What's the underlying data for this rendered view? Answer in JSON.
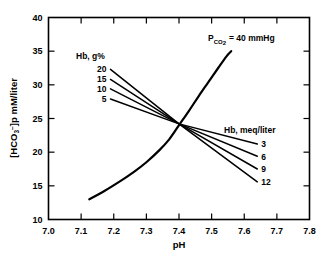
{
  "chart_data": {
    "type": "line",
    "title": "",
    "xlabel": "pH",
    "ylabel": "[HCO₃⁻]p mM/liter",
    "xlim": [
      7.0,
      7.8
    ],
    "ylim": [
      10,
      40
    ],
    "xticks": [
      "7.0",
      "7.1",
      "7.2",
      "7.3",
      "7.4",
      "7.5",
      "7.6",
      "7.7",
      "7.8"
    ],
    "yticks": [
      "10",
      "15",
      "20",
      "25",
      "30",
      "35",
      "40"
    ],
    "grid": false,
    "legend_position": "inline-annotations",
    "annotations": [
      {
        "name": "pco2-label",
        "text": "P",
        "subscript": "CO",
        "subscript2": "2",
        "rest": "=  40  mmHg",
        "full_text": "P CO2 = 40 mmHg",
        "x": 7.45,
        "y": 36.8
      },
      {
        "name": "hb-gpercent-header",
        "text": "Hb, g%",
        "x": 7.17,
        "y": 34.2
      },
      {
        "name": "hb-meq-header",
        "text": "Hb, meq/liter",
        "x": 7.58,
        "y": 25.4
      }
    ],
    "intersection": {
      "x": 7.4,
      "y": 24.2
    },
    "series": [
      {
        "name": "pco2-40-isobar",
        "label": "P CO2 = 40 mmHg",
        "style": "curve-thick",
        "points": [
          [
            7.125,
            13.0
          ],
          [
            7.17,
            14.2
          ],
          [
            7.22,
            15.7
          ],
          [
            7.26,
            17.0
          ],
          [
            7.3,
            18.5
          ],
          [
            7.34,
            20.3
          ],
          [
            7.37,
            21.9
          ],
          [
            7.4,
            24.0
          ],
          [
            7.43,
            26.1
          ],
          [
            7.46,
            28.3
          ],
          [
            7.49,
            30.4
          ],
          [
            7.52,
            32.5
          ],
          [
            7.545,
            34.2
          ],
          [
            7.56,
            35.0
          ]
        ]
      },
      {
        "name": "hb-20-gpercent",
        "left_label": "20",
        "right_label": "12",
        "left_label_value": 20,
        "right_label_value": 12,
        "points": [
          [
            7.19,
            32.3
          ],
          [
            7.4,
            24.2
          ],
          [
            7.64,
            15.6
          ]
        ]
      },
      {
        "name": "hb-15-gpercent",
        "left_label": "15",
        "right_label": "9",
        "left_label_value": 15,
        "right_label_value": 9,
        "points": [
          [
            7.19,
            30.8
          ],
          [
            7.4,
            24.2
          ],
          [
            7.64,
            17.5
          ]
        ]
      },
      {
        "name": "hb-10-gpercent",
        "left_label": "10",
        "right_label": "6",
        "left_label_value": 10,
        "right_label_value": 6,
        "points": [
          [
            7.19,
            29.4
          ],
          [
            7.4,
            24.2
          ],
          [
            7.64,
            19.4
          ]
        ]
      },
      {
        "name": "hb-5-gpercent",
        "left_label": "5",
        "right_label": "3",
        "left_label_value": 5,
        "right_label_value": 3,
        "points": [
          [
            7.19,
            27.9
          ],
          [
            7.4,
            24.2
          ],
          [
            7.64,
            21.2
          ]
        ]
      }
    ],
    "left_labels": [
      "20",
      "15",
      "10",
      "5"
    ],
    "right_labels": [
      "3",
      "6",
      "9",
      "12"
    ]
  }
}
